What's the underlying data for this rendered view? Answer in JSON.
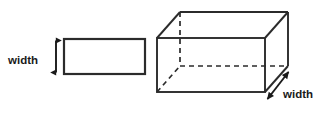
{
  "figure": {
    "background_color": "#ffffff",
    "stroke_color": "#2b2b2b",
    "text_color": "#1a1a1a",
    "shapes": {
      "rectangle": {
        "name": "2d-rectangle",
        "x": 64,
        "y": 39,
        "width": 81,
        "height": 35,
        "stroke_width": 2.2,
        "fill": "none"
      },
      "prism": {
        "name": "3d-rectangular-prism",
        "front_face": {
          "left": 157,
          "top": 38,
          "right": 265,
          "bottom": 92
        },
        "depth_offset": {
          "dx": 23,
          "dy": -26
        },
        "stroke_width": 1.9,
        "hidden_edge_dash": "5,4"
      }
    },
    "labels": [
      {
        "name": "width-label-rectangle",
        "text": "width",
        "x": 8,
        "y": 61
      },
      {
        "name": "width-label-prism",
        "text": "width",
        "x": 283,
        "y": 95
      }
    ],
    "arrows": [
      {
        "name": "width-arrow-vertical",
        "orientation": "vertical-double-headed",
        "x1": 56,
        "y1": 39,
        "x2": 56,
        "y2": 74
      },
      {
        "name": "width-arrow-diagonal",
        "orientation": "diagonal-double-headed",
        "x1": 266,
        "y1": 101,
        "x2": 290,
        "y2": 70
      }
    ]
  }
}
